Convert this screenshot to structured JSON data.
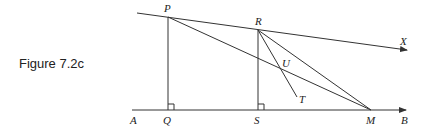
{
  "caption": "Figure 7.2c",
  "labels": {
    "P": "P",
    "R": "R",
    "X": "X",
    "U": "U",
    "T": "T",
    "A": "A",
    "Q": "Q",
    "S": "S",
    "M": "M",
    "B": "B"
  },
  "colors": {
    "line": "#333333",
    "text": "#222222",
    "background": "#ffffff"
  }
}
